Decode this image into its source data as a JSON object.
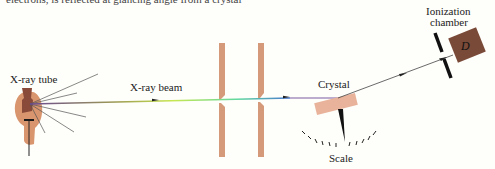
{
  "diagram": {
    "top_cropped_text": "electrons, is reflected at glancing angle from a crystal",
    "labels": {
      "tube": "X-ray tube",
      "beam": "X-ray beam",
      "crystal": "Crystal",
      "scale": "Scale",
      "chamber_line1": "Ionization",
      "chamber_line2": "chamber",
      "detector": "D"
    },
    "colors": {
      "background": "#fefefb",
      "tube_body": "#d9956e",
      "tube_anode": "#8a4a3a",
      "slit": "#d49a7a",
      "crystal": "#e8b39a",
      "chamber": "#7a4a38",
      "beam_start": "#7a5aa0",
      "beam_mid": "#c8e040",
      "beam_end": "#3a7ad0",
      "ray": "#555555",
      "ink": "#1a1a1a"
    }
  }
}
